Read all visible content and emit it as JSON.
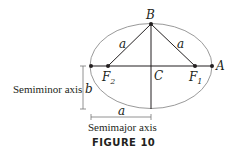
{
  "figure": {
    "caption": "FIGURE 10",
    "points": {
      "B": "B",
      "A": "A",
      "C": "C",
      "F1": "F",
      "F1_sub": "1",
      "F2": "F",
      "F2_sub": "2"
    },
    "segment_labels": {
      "left_side": "a",
      "right_side": "a",
      "semimajor": "a",
      "semiminor": "b"
    },
    "annotations": {
      "semiminor_axis": "Semiminor axis",
      "semimajor_axis": "Semimajor axis"
    },
    "colors": {
      "ellipse": "#9a9a9a",
      "lines": "#231f20"
    }
  }
}
